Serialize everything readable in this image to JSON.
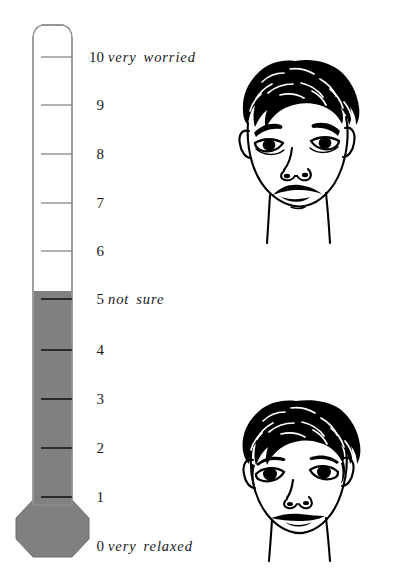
{
  "page": {
    "background_color": "#ffffff",
    "width": 394,
    "height": 585
  },
  "thermometer": {
    "name": "worry-thermometer",
    "orientation": "vertical",
    "scale_min": 0,
    "scale_max": 10,
    "fill_level": 5,
    "fill_color": "#808080",
    "tube_color": "#ffffff",
    "outline_color": "#9a9a9a",
    "tick_color": "#2b2b2b",
    "bulb_shape": "octagon",
    "ticks": [
      {
        "value": "10",
        "y": 57
      },
      {
        "value": "9",
        "y": 105
      },
      {
        "value": "8",
        "y": 154
      },
      {
        "value": "7",
        "y": 203
      },
      {
        "value": "6",
        "y": 251
      },
      {
        "value": "5",
        "y": 299
      },
      {
        "value": "4",
        "y": 350
      },
      {
        "value": "3",
        "y": 399
      },
      {
        "value": "2",
        "y": 448
      },
      {
        "value": "1",
        "y": 497
      },
      {
        "value": "0",
        "y": 546
      }
    ]
  },
  "anchors": {
    "high": {
      "value": "10",
      "label": "very worried",
      "y": 50
    },
    "mid": {
      "value": "5",
      "label": "not sure",
      "y": 292
    },
    "low": {
      "value": "0",
      "label": "very relaxed",
      "y": 539
    }
  },
  "faces": [
    {
      "id": "face-worried",
      "name": "worried-face-illustration",
      "expression": "worried",
      "description": "line drawing of a child's face with curly hair, raised inner eyebrows, droopy eyes and a frowning mouth",
      "corresponds_to": "very worried"
    },
    {
      "id": "face-relaxed",
      "name": "relaxed-face-illustration",
      "expression": "relaxed",
      "description": "line drawing of a child's face with curly hair, level eyebrows, open eyes and a calm straight mouth",
      "corresponds_to": "very relaxed"
    }
  ]
}
